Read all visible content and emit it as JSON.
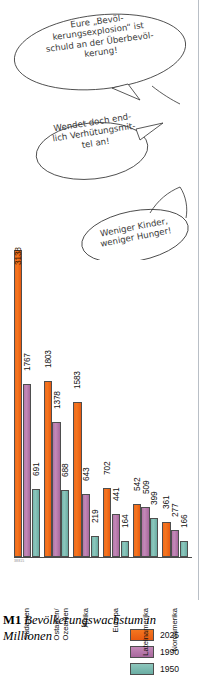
{
  "speech_bubbles": [
    {
      "id": "bubble-overpopulation",
      "text": "Eure „Bevöl-\nkerungsexplosion“ ist\nschuld an der Überbevöl-\nkerung!"
    },
    {
      "id": "bubble-contraception",
      "text": "Wendet doch end-\nlich Verhütungsmit-\ntel an!"
    },
    {
      "id": "bubble-hunger",
      "text": "Weniger Kinder,\nweniger Hunger!"
    }
  ],
  "chart_data": {
    "type": "bar",
    "title": "Bevölkerungswachstum in Millionen",
    "xlabel": "",
    "ylabel": "Millionen",
    "ylim": [
      0,
      3138
    ],
    "grid": false,
    "legend_position": "top-right",
    "categories": [
      "Südasien",
      "Ostasien/\nOzeanien",
      "Afrika",
      "Europa",
      "Lateinamerika",
      "Nordamerika"
    ],
    "series": [
      {
        "name": "2025",
        "color": "#f4761f",
        "values": [
          3138,
          1803,
          1583,
          702,
          542,
          361
        ]
      },
      {
        "name": "1990",
        "color": "#b87aad",
        "values": [
          1767,
          1378,
          643,
          441,
          509,
          277
        ]
      },
      {
        "name": "1950",
        "color": "#7dbdb3",
        "values": [
          691,
          688,
          219,
          164,
          399,
          166
        ]
      }
    ]
  },
  "legend": {
    "items": [
      {
        "label": "2025",
        "color": "#f4761f"
      },
      {
        "label": "1990",
        "color": "#b87aad"
      },
      {
        "label": "1950",
        "color": "#7dbdb3"
      }
    ]
  },
  "source_note": "38815",
  "caption": {
    "id": "M1",
    "text": "Bevölkerungswachstum in Millionen"
  }
}
